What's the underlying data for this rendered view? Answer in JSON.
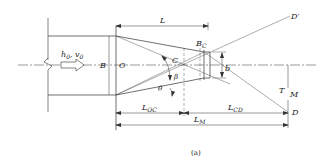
{
  "diagram": {
    "type": "hydraulic-contraction-schematic",
    "caption": "(a)",
    "labels": {
      "flow": "h",
      "flow_sub0": "0",
      "flow_sep": ", ",
      "flow_v": "v",
      "flow_v_sub": "0",
      "B": "B",
      "O": "O",
      "C": "C",
      "Bc": "B",
      "Bc_sub": "C",
      "b": "b",
      "beta": "β",
      "theta": "θ",
      "D_prime": "D",
      "D_prime_mark": "′",
      "D": "D",
      "T": "T",
      "M": "M",
      "L": "L",
      "L_OC": "L",
      "L_OC_sub": "OC",
      "L_CD": "L",
      "L_CD_sub": "CD",
      "L_M": "L",
      "L_M_sub": "M"
    },
    "colors": {
      "line": "#333333",
      "background": "#ffffff"
    }
  }
}
